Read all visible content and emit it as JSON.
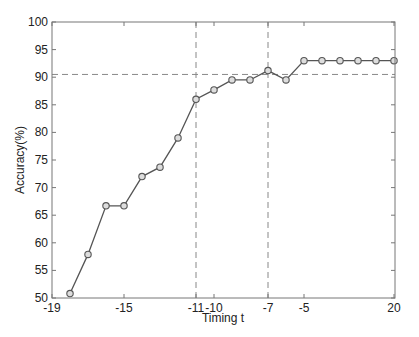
{
  "chart_data": {
    "type": "line",
    "title": "",
    "xlabel": "Timing t",
    "ylabel": "Accuracy(%)",
    "ylim": [
      50,
      100
    ],
    "yticks": [
      50,
      55,
      60,
      65,
      70,
      75,
      80,
      85,
      90,
      95,
      100
    ],
    "xtick_labels": [
      "-19",
      "-15",
      "-11",
      "-10",
      "-7",
      "-5",
      "20"
    ],
    "grid": false,
    "legend": null,
    "x": [
      "-18",
      "-17",
      "-16",
      "-15",
      "-14",
      "-13",
      "-12",
      "-11",
      "-10",
      "-9",
      "-8",
      "-7",
      "-6",
      "-5",
      "-4",
      "-3",
      "-2",
      "-1",
      "20"
    ],
    "series": [
      {
        "name": "Accuracy",
        "marker": "circle",
        "color": "#555555",
        "values": [
          50.8,
          57.9,
          66.7,
          66.7,
          72.0,
          73.7,
          79.0,
          86.0,
          87.7,
          89.5,
          89.5,
          91.2,
          89.5,
          93.0,
          93.0,
          93.0,
          93.0,
          93.0,
          93.0
        ]
      }
    ],
    "reference_lines": {
      "horizontal": [
        {
          "y": 90.5,
          "style": "dashed"
        }
      ],
      "vertical": [
        {
          "x": "-11",
          "style": "dashed"
        },
        {
          "x": "-7",
          "style": "dashed"
        }
      ]
    }
  }
}
